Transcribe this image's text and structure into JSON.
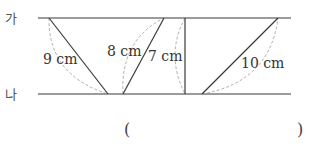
{
  "lines": {
    "top_label": "가",
    "bottom_label": "나"
  },
  "segments": [
    {
      "label": "9 cm"
    },
    {
      "label": "8 cm"
    },
    {
      "label": "7 cm"
    },
    {
      "label": "10 cm"
    }
  ],
  "answer": {
    "open_paren": "(",
    "close_paren": ")"
  },
  "colors": {
    "parallel_line": "#7a7a7a",
    "segment": "#3a3a3a",
    "dashed_arc": "#9a9a9a"
  }
}
